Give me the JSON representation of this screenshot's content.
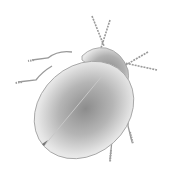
{
  "image": {
    "subject": "beetle illustration",
    "description": "Grayscale pencil-style drawing of a round leaf beetle seen from above, with six segmented legs and two beaded antennae",
    "colors": {
      "background": "#ffffff",
      "outline": "#8a8a8a",
      "shade_dark": "#7a7a7a",
      "shade_light": "#f2f2f2"
    }
  }
}
